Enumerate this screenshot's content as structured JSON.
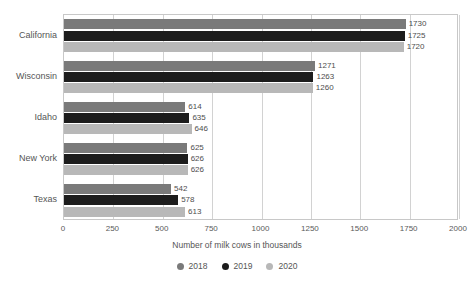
{
  "chart_data": {
    "type": "bar",
    "orientation": "horizontal",
    "title": "",
    "xlabel": "Number of milk cows in thousands",
    "ylabel": "",
    "xlim": [
      0,
      2000
    ],
    "xticks": [
      "0",
      "250",
      "500",
      "750",
      "1000",
      "1250",
      "1500",
      "1750",
      "2000"
    ],
    "grid": true,
    "legend_position": "bottom",
    "categories": [
      "California",
      "Wisconsin",
      "Idaho",
      "New York",
      "Texas"
    ],
    "series": [
      {
        "name": "2018",
        "color": "#7a7a7a",
        "values": [
          1730,
          1271,
          614,
          625,
          542
        ]
      },
      {
        "name": "2019",
        "color": "#1c1c1c",
        "values": [
          1725,
          1263,
          635,
          626,
          578
        ]
      },
      {
        "name": "2020",
        "color": "#b8b8b8",
        "values": [
          1720,
          1260,
          646,
          626,
          613
        ]
      }
    ],
    "data_labels": [
      [
        "1730",
        "1725",
        "1720"
      ],
      [
        "1271",
        "1263",
        "1260"
      ],
      [
        "614",
        "635",
        "646"
      ],
      [
        "625",
        "626",
        "626"
      ],
      [
        "542",
        "578",
        "613"
      ]
    ]
  },
  "legend": {
    "items": [
      {
        "label": "2018",
        "color": "#7a7a7a"
      },
      {
        "label": "2019",
        "color": "#1c1c1c"
      },
      {
        "label": "2020",
        "color": "#b8b8b8"
      }
    ]
  },
  "axis": {
    "x_title": "Number of milk cows in thousands"
  }
}
